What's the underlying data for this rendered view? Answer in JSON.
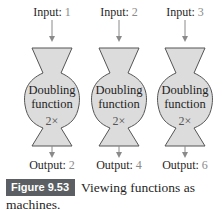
{
  "figure": {
    "label": "Figure 9.53",
    "caption": "Viewing functions as machines.",
    "colors": {
      "machine_fill": "#dcdcdc",
      "machine_stroke": "#555555",
      "arrow": "#8a8a8a",
      "badge_bg": "#5b5f63",
      "value_text": "#8a8a8a"
    }
  },
  "machines": [
    {
      "input_label": "Input:",
      "input_value": "1",
      "name_line1": "Doubling",
      "name_line2": "function",
      "operation": "2×",
      "output_label": "Output:",
      "output_value": "2"
    },
    {
      "input_label": "Input:",
      "input_value": "2",
      "name_line1": "Doubling",
      "name_line2": "function",
      "operation": "2×",
      "output_label": "Output:",
      "output_value": "4"
    },
    {
      "input_label": "Input:",
      "input_value": "3",
      "name_line1": "Doubling",
      "name_line2": "function",
      "operation": "2×",
      "output_label": "Output:",
      "output_value": "6"
    }
  ]
}
